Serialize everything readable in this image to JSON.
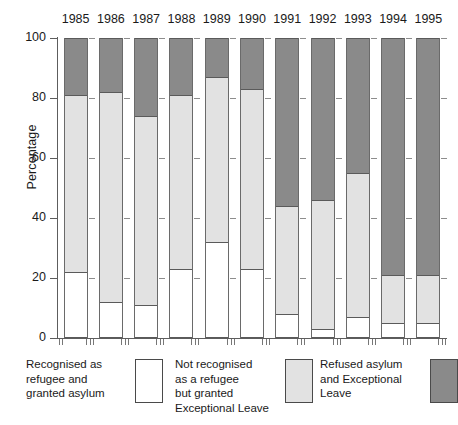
{
  "chart_data": {
    "type": "bar",
    "subtype": "stacked-percentage-column",
    "title": "",
    "xlabel": "",
    "ylabel": "Percentage",
    "ylim": [
      0,
      100
    ],
    "yticks": [
      0,
      20,
      40,
      60,
      80,
      100
    ],
    "ytick_labels": [
      "0",
      "20",
      "40",
      "60",
      "80",
      "100"
    ],
    "grid": false,
    "legend_position": "bottom",
    "categories": [
      "1985",
      "1986",
      "1987",
      "1988",
      "1989",
      "1990",
      "1991",
      "1992",
      "1993",
      "1994",
      "1995"
    ],
    "series": [
      {
        "name": "Recognised as refugee and granted asylum",
        "color": "#ffffff",
        "values": [
          22,
          12,
          11,
          23,
          32,
          23,
          8,
          3,
          7,
          5,
          5
        ]
      },
      {
        "name": "Not recognised as a refugee but granted Exceptional Leave",
        "color": "#e2e2e2",
        "values": [
          59,
          70,
          63,
          58,
          55,
          60,
          36,
          43,
          48,
          16,
          16
        ]
      },
      {
        "name": "Refused asylum and Exceptional Leave",
        "color": "#8a8a8a",
        "values": [
          19,
          18,
          26,
          19,
          13,
          17,
          56,
          54,
          45,
          79,
          79
        ]
      }
    ],
    "cumulative_tops": {
      "white": [
        22,
        12,
        11,
        23,
        32,
        23,
        8,
        3,
        7,
        5,
        5
      ],
      "white_plus_light": [
        81,
        82,
        74,
        81,
        87,
        83,
        44,
        46,
        55,
        21,
        21
      ],
      "total": [
        100,
        100,
        100,
        100,
        100,
        100,
        100,
        100,
        100,
        100,
        100
      ]
    }
  },
  "legend": {
    "entries": [
      {
        "label": "Recognised as\nrefugee and\ngranted asylum",
        "swatch": "white",
        "swatch_name": "legend-swatch-recognised"
      },
      {
        "label": "Not recognised\nas a refugee\nbut granted\nExceptional Leave",
        "swatch": "white",
        "swatch_name": "legend-swatch-exceptional-leave"
      },
      {
        "label": "Refused asylum\nand Exceptional\nLeave",
        "swatch": "light",
        "swatch_name": "legend-swatch-refused"
      }
    ]
  },
  "colors": {
    "recognised": "#ffffff",
    "exceptional_leave": "#e2e2e2",
    "refused": "#8a8a8a",
    "axis": "#5d5d5d",
    "text": "#1a1a1a"
  }
}
